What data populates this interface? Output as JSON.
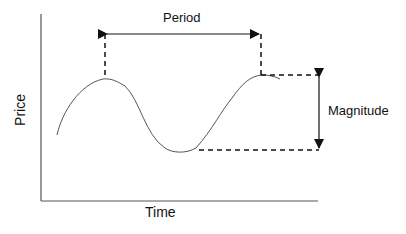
{
  "diagram": {
    "title": "",
    "labels": {
      "period": "Period",
      "magnitude": "Magnitude",
      "x_axis": "Time",
      "y_axis": "Price"
    },
    "colors": {
      "line": "#111111",
      "curve": "#555555",
      "background": "#ffffff"
    }
  }
}
